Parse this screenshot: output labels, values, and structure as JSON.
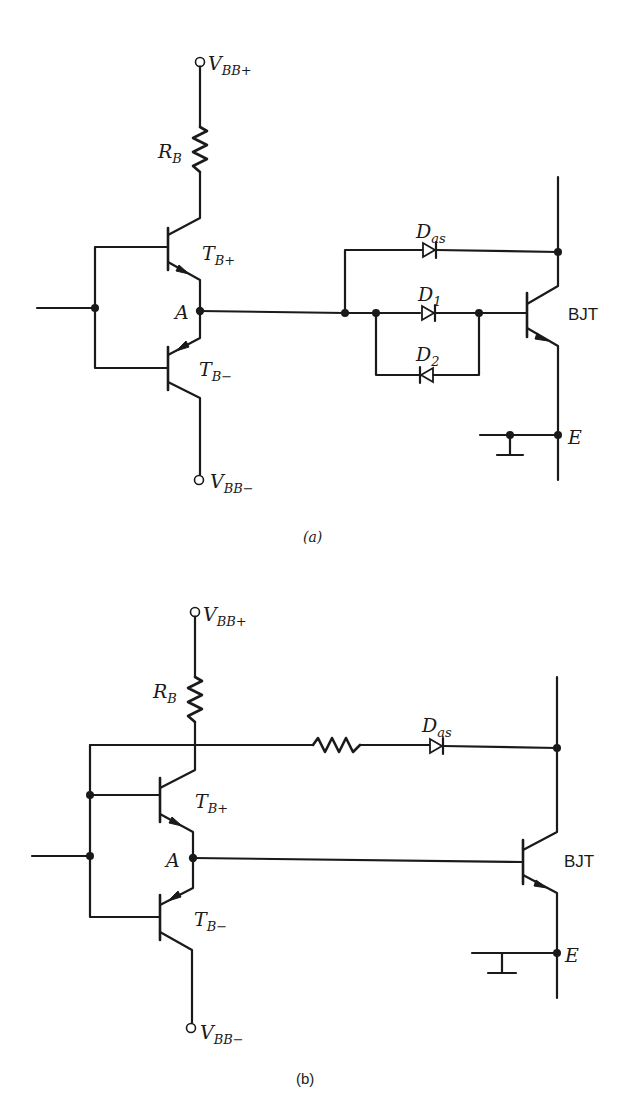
{
  "figure": {
    "panels": [
      {
        "id": "a",
        "caption": "(a)",
        "labels": {
          "vbb_plus_main": "V",
          "vbb_plus_sub": "BB+",
          "rb_main": "R",
          "rb_sub": "B",
          "tbp_main": "T",
          "tbp_sub": "B+",
          "node_a": "A",
          "tbm_main": "T",
          "tbm_sub": "B−",
          "vbb_minus_main": "V",
          "vbb_minus_sub": "BB−",
          "das_main": "D",
          "das_sub": "as",
          "d1_main": "D",
          "d1_sub": "1",
          "d2_main": "D",
          "d2_sub": "2",
          "bjt": "BJT",
          "emitter": "E"
        },
        "components": [
          "V_BB+ supply terminal",
          "R_B base resistor",
          "T_B+ NPN driver transistor",
          "T_B- PNP driver transistor",
          "Node A",
          "D_as anti-saturation diode",
          "D1 series diode",
          "D2 antiparallel diode",
          "BJT power transistor",
          "E emitter terminal",
          "V_BB- supply terminal"
        ]
      },
      {
        "id": "b",
        "caption": "(b)",
        "labels": {
          "vbb_plus_main": "V",
          "vbb_plus_sub": "BB+",
          "rb_main": "R",
          "rb_sub": "B",
          "tbp_main": "T",
          "tbp_sub": "B+",
          "node_a": "A",
          "tbm_main": "T",
          "tbm_sub": "B−",
          "vbb_minus_main": "V",
          "vbb_minus_sub": "BB−",
          "das_main": "D",
          "das_sub": "as",
          "bjt": "BJT",
          "emitter": "E"
        },
        "components": [
          "V_BB+ supply terminal",
          "R_B base resistor",
          "T_B+ NPN driver transistor",
          "T_B- PNP driver transistor",
          "Node A",
          "Series resistor",
          "D_as anti-saturation diode",
          "BJT power transistor",
          "E emitter terminal",
          "V_BB- supply terminal"
        ]
      }
    ]
  }
}
